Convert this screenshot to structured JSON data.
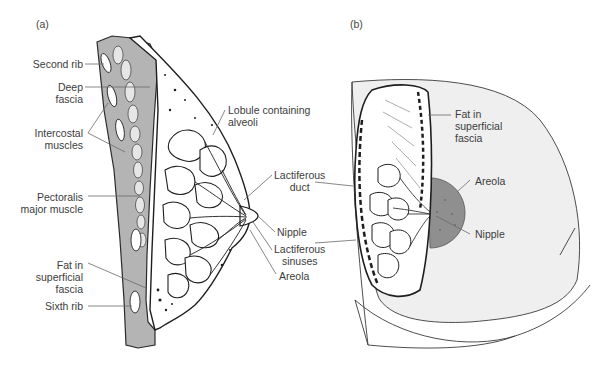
{
  "figure": {
    "panels": [
      {
        "id": "a",
        "tag": "(a)",
        "view": "sagittal section",
        "labels": {
          "second_rib": "Second rib",
          "deep_fascia": "Deep\nfascia",
          "intercostal_muscles": "Intercostal\nmuscles",
          "pectoralis_major": "Pectoralis\nmajor muscle",
          "fat_superficial_fascia": "Fat in\nsuperficial\nfascia",
          "sixth_rib": "Sixth rib",
          "lobule": "Lobule containing\nalveoli",
          "lactiferous_duct": "Lactiferous\nduct",
          "nipple": "Nipple",
          "lactiferous_sinuses": "Lactiferous\nsinuses",
          "areola": "Areola"
        }
      },
      {
        "id": "b",
        "tag": "(b)",
        "view": "anterior cut-away view",
        "labels": {
          "fat_superficial_fascia": "Fat in\nsuperficial\nfascia",
          "areola": "Areola",
          "nipple": "Nipple"
        }
      }
    ],
    "colors": {
      "line": "#2a2a2a",
      "leader": "#6a6a6a",
      "muscle_gray": "#a9a9a9",
      "skin_gray": "#eeeeee",
      "areola_gray": "#8f8f8f",
      "text": "#3c3c3c"
    }
  }
}
